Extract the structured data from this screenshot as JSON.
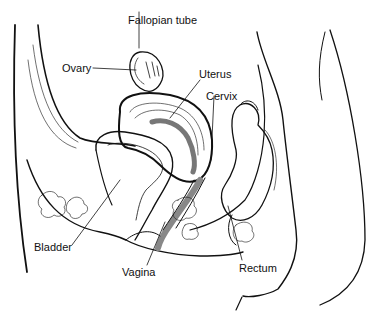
{
  "diagram": {
    "type": "anatomical-cross-section",
    "labels": [
      {
        "id": "fallopian-tube",
        "text": "Fallopian tube",
        "x": 128,
        "y": 14
      },
      {
        "id": "ovary",
        "text": "Ovary",
        "x": 62,
        "y": 62
      },
      {
        "id": "uterus",
        "text": "Uterus",
        "x": 199,
        "y": 68
      },
      {
        "id": "cervix",
        "text": "Cervix",
        "x": 206,
        "y": 90
      },
      {
        "id": "bladder",
        "text": "Bladder",
        "x": 34,
        "y": 241
      },
      {
        "id": "vagina",
        "text": "Vagina",
        "x": 122,
        "y": 266
      },
      {
        "id": "rectum",
        "text": "Rectum",
        "x": 239,
        "y": 262
      }
    ],
    "colors": {
      "line": "#111111",
      "shade": "#8a8a8a",
      "background": "#ffffff"
    }
  }
}
